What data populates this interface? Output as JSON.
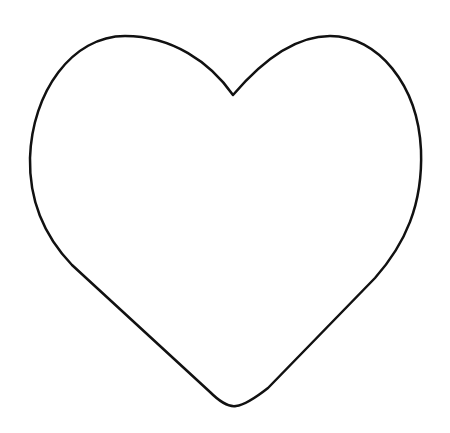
{
  "image": {
    "description": "Heart outline",
    "background_color": "#ffffff",
    "shape": {
      "type": "heart",
      "fill_color": "#ffffff",
      "stroke_color": "#111111",
      "stroke_width": 2.5
    }
  }
}
